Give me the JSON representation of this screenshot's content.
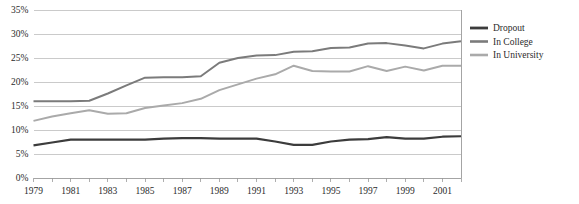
{
  "chart_data": {
    "type": "line",
    "title": "",
    "xlabel": "",
    "ylabel": "",
    "ylim": [
      0,
      35
    ],
    "ytick_labels": [
      "0%",
      "5%",
      "10%",
      "15%",
      "20%",
      "25%",
      "30%",
      "35%"
    ],
    "ytick_values": [
      0,
      5,
      10,
      15,
      20,
      25,
      30,
      35
    ],
    "grid": true,
    "legend_position": "right",
    "x": [
      1979,
      1980,
      1981,
      1982,
      1983,
      1984,
      1985,
      1986,
      1987,
      1988,
      1989,
      1990,
      1991,
      1992,
      1993,
      1994,
      1995,
      1996,
      1997,
      1998,
      1999,
      2000,
      2001,
      2002
    ],
    "xtick_labels": [
      "1979",
      "1981",
      "1983",
      "1985",
      "1987",
      "1989",
      "1991",
      "1993",
      "1995",
      "1997",
      "1999",
      "2001"
    ],
    "xtick_label_values": [
      1979,
      1981,
      1983,
      1985,
      1987,
      1989,
      1991,
      1993,
      1995,
      1997,
      1999,
      2001
    ],
    "series": [
      {
        "name": "Dropout",
        "color": "#3c3c3c",
        "width": 2.2,
        "values": [
          6.8,
          7.4,
          8.0,
          8.0,
          8.0,
          8.0,
          8.0,
          8.2,
          8.3,
          8.3,
          8.2,
          8.2,
          8.2,
          7.6,
          6.9,
          6.9,
          7.6,
          8.0,
          8.1,
          8.5,
          8.2,
          8.2,
          8.6,
          8.7
        ]
      },
      {
        "name": "In College",
        "color": "#7b7b7b",
        "width": 2.0,
        "values": [
          16.0,
          16.0,
          16.0,
          16.1,
          17.6,
          19.3,
          20.9,
          21.0,
          21.0,
          21.2,
          24.0,
          25.0,
          25.5,
          25.6,
          26.3,
          26.4,
          27.1,
          27.2,
          28.0,
          28.1,
          27.6,
          27.0,
          28.0,
          28.5
        ]
      },
      {
        "name": "In University",
        "color": "#aaaaaa",
        "width": 2.0,
        "values": [
          11.9,
          12.8,
          13.5,
          14.1,
          13.4,
          13.5,
          14.6,
          15.1,
          15.6,
          16.5,
          18.3,
          19.5,
          20.7,
          21.6,
          23.4,
          22.3,
          22.2,
          22.2,
          23.3,
          22.3,
          23.2,
          22.4,
          23.4,
          23.4
        ]
      }
    ]
  },
  "legend": {
    "entries": [
      {
        "label": "Dropout"
      },
      {
        "label": "In College"
      },
      {
        "label": "In University"
      }
    ]
  }
}
